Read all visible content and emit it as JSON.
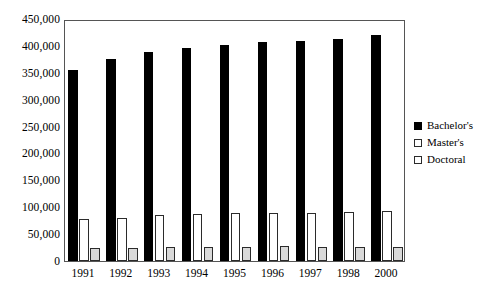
{
  "chart_data": {
    "type": "bar",
    "title": "",
    "subtitle": "",
    "xlabel": "",
    "ylabel": "",
    "categories": [
      "1991",
      "1992",
      "1993",
      "1994",
      "1995",
      "1996",
      "1997",
      "1998",
      "2000"
    ],
    "series": [
      {
        "name": "Bachelor's",
        "color": "#000000",
        "values": [
          355000,
          375000,
          388000,
          397000,
          402000,
          407000,
          410000,
          413000,
          420000
        ]
      },
      {
        "name": "Master's",
        "color": "#ffffff",
        "values": [
          78000,
          80000,
          85000,
          88000,
          89000,
          90000,
          90000,
          91000,
          93000
        ]
      },
      {
        "name": "Doctoral",
        "color": "#d9d9d9",
        "values": [
          25000,
          25000,
          26000,
          26000,
          26000,
          27000,
          26000,
          26000,
          26000
        ]
      }
    ],
    "ylim": [
      0,
      450000
    ],
    "ytick_labels": [
      "450,000",
      "400,000",
      "350,000",
      "300,000",
      "250,000",
      "200,000",
      "150,000",
      "100,000",
      "50,000",
      "0"
    ],
    "ytick_values": [
      450000,
      400000,
      350000,
      300000,
      250000,
      200000,
      150000,
      100000,
      50000,
      0
    ],
    "grid": false,
    "legend_position": "right"
  },
  "legend": {
    "items": [
      {
        "label": "Bachelor's"
      },
      {
        "label": "Master's"
      },
      {
        "label": "Doctoral"
      }
    ]
  }
}
